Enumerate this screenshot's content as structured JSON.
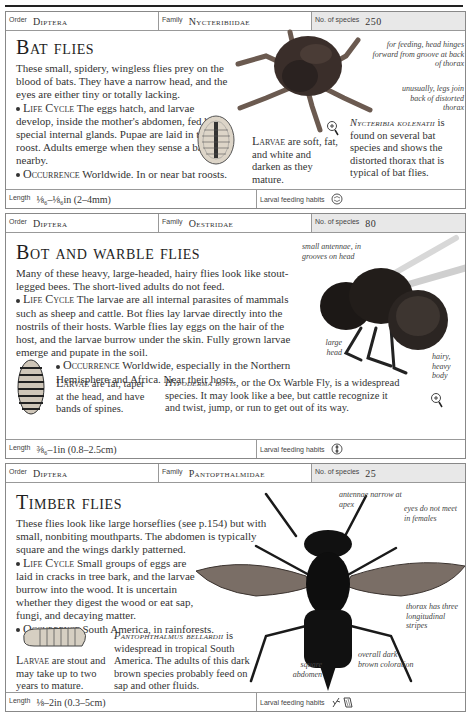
{
  "entries": [
    {
      "order_label": "Order",
      "order": "Diptera",
      "family_label": "Family",
      "family": "Nycteribiidae",
      "species_label": "No. of species",
      "species_count": "250",
      "title": "Bat flies",
      "intro": "These small, spidery, wingless flies prey on the blood of bats. They have a narrow head, and the eyes are either tiny or totally lacking.",
      "life_cycle_heading": "Life Cycle",
      "life_cycle": "The eggs hatch, and larvae develop, inside the mother's abdomen, fed by special internal glands. Pupae are laid in the bat roost. Adults emerge when they sense a bat nearby.",
      "occurrence_heading": "Occurrence",
      "occurrence": "Worldwide. In or near bat roosts.",
      "larvae_heading": "Larvae",
      "larvae": "are soft, fat, and white and darken as they mature.",
      "specimen_name": "Nycteribia kolenatii",
      "specimen_text": "is found on several bat species and shows the distorted thorax that is typical of bat flies.",
      "annotations": [
        "for feeding, head hinges forward from groove at back of thorax",
        "unusually, legs join back of distorted thorax"
      ],
      "length_label": "Length",
      "length": "⅛₆–⅛₆in (2–4mm)",
      "larval_feeding_label": "Larval feeding habits",
      "larval_feeding_icon": "parasite-icon"
    },
    {
      "order_label": "Order",
      "order": "Diptera",
      "family_label": "Family",
      "family": "Oestridae",
      "species_label": "No. of species",
      "species_count": "80",
      "title": "Bot and warble flies",
      "intro": "Many of these heavy, large-headed, hairy flies look like stout-legged bees. The short-lived adults do not feed.",
      "life_cycle_heading": "Life Cycle",
      "life_cycle": "The larvae are all internal parasites of mammals such as sheep and cattle. Bot flies lay larvae directly into the nostrils of their hosts. Warble flies lay eggs on the hair of the host, and the larvae burrow under the skin. Fully grown larvae emerge and pupate in the soil.",
      "occurrence_heading": "Occurrence",
      "occurrence": "Worldwide, especially in the Northern Hemisphere and Africa. Near their hosts.",
      "larvae_heading": "Larvae",
      "larvae": "are fat, taper at the head, and have bands of spines.",
      "specimen_name": "Hypoderma bovis",
      "specimen_text": ", or the Ox Warble Fly, is a widespread species. It may look like a bee, but cattle recognize it and twist, jump, or run to get out of its way.",
      "annotations": [
        "small antennae, in grooves on head",
        "large head",
        "hairy, heavy body"
      ],
      "length_label": "Length",
      "length": "⅜₆–1in (0.8–2.5cm)",
      "larval_feeding_label": "Larval feeding habits",
      "larval_feeding_icon": "internal-parasite-icon"
    },
    {
      "order_label": "Order",
      "order": "Diptera",
      "family_label": "Family",
      "family": "Pantopthalmidae",
      "species_label": "No. of species",
      "species_count": "25",
      "title": "Timber flies",
      "intro": "These flies look like large horseflies (see p.154) but with small, nonbiting mouthparts. The abdomen is typically square and the wings darkly patterned.",
      "life_cycle_heading": "Life Cycle",
      "life_cycle": "Small groups of eggs are laid in cracks in tree bark, and the larvae burrow into the wood. It is uncertain whether they digest the wood or eat sap, fungi, and decaying matter.",
      "occurrence_heading": "Occurrence",
      "occurrence": "South America, in rainforests.",
      "larvae_heading": "Larvae",
      "larvae": "are stout and may take up to two years to mature.",
      "specimen_name": "Pantophthalmus bellardii",
      "specimen_text": "is widespread in tropical South America. The adults of this dark brown species probably feed on sap and other fluids.",
      "annotations": [
        "antennae narrow at apex",
        "eyes do not meet in females",
        "thorax has three longitudinal stripes",
        "square abdomen",
        "overall dark brown coloration"
      ],
      "length_label": "Length",
      "length": "⅛–2in (0.3–5cm)",
      "larval_feeding_label": "Larval feeding habits",
      "larval_feeding_icon": "plant-wood-icon"
    }
  ]
}
